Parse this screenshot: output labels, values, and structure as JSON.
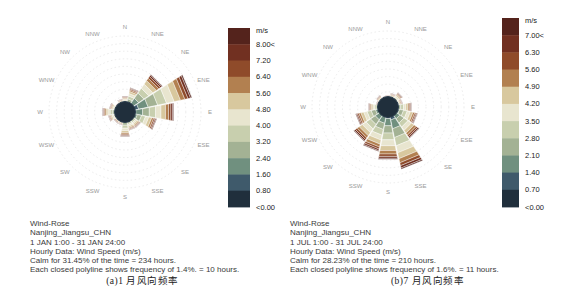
{
  "page": {
    "background": "#ffffff"
  },
  "chart_data": [
    {
      "type": "wind_rose",
      "panel_label": "a",
      "station": "Nanjing_Jiangsu_CHN",
      "period": "1 JAN 1:00 - 31 JAN 24:00",
      "info_lines": [
        "Wind-Rose",
        "Nanjing_Jiangsu_CHN",
        "1 JAN 1:00 - 31 JAN 24:00",
        "Hourly Data: Wind Speed (m/s)",
        "Calm for 31.45% of the time = 234 hours.",
        "Each closed polyline shows frequency of 1.4%. = 10 hours."
      ],
      "caption": "(a)1 月风向频率",
      "calm_pct": 31.45,
      "calm_hours": 234,
      "ring_step_pct": 1.4,
      "ring_count": 10,
      "legend": {
        "unit": "m/s",
        "labels": [
          "8.00<",
          "7.20",
          "6.40",
          "5.60",
          "4.80",
          "4.00",
          "3.20",
          "2.40",
          "1.60",
          "0.80",
          "<0.00"
        ],
        "colors": [
          "#54231c",
          "#713021",
          "#8f4b2a",
          "#b28050",
          "#d8c89e",
          "#e8e5cf",
          "#c8cfae",
          "#a3b294",
          "#70907f",
          "#3f5a6b",
          "#202f3c"
        ]
      },
      "directions": [
        "N",
        "NNE",
        "NE",
        "ENE",
        "E",
        "ESE",
        "SE",
        "SSE",
        "S",
        "SSW",
        "SW",
        "WSW",
        "W",
        "WNW",
        "NW",
        "NNW"
      ],
      "frequencies_pct": [
        3.0,
        4.6,
        8.4,
        12.6,
        9.1,
        6.0,
        3.5,
        3.5,
        4.6,
        2.5,
        2.5,
        3.2,
        4.2,
        3.0,
        2.1,
        2.5
      ],
      "band_profile": [
        0.16,
        0.15,
        0.15,
        0.14,
        0.12,
        0.1,
        0.07,
        0.05,
        0.04,
        0.02
      ]
    },
    {
      "type": "wind_rose",
      "panel_label": "b",
      "station": "Nanjing_Jiangsu_CHN",
      "period": "1 JUL 1:00 - 31 JUL 24:00",
      "info_lines": [
        "Wind-Rose",
        "Nanjing_Jiangsu_CHN",
        "1 JUL 1:00 - 31 JUL 24:00",
        "Hourly Data: Wind Speed (m/s)",
        "Calm for 28.23% of the time = 210 hours.",
        "Each closed polyline shows frequency of 1.6%. = 11 hours."
      ],
      "caption": "(b)7 月风向频率",
      "calm_pct": 28.23,
      "calm_hours": 210,
      "ring_step_pct": 1.6,
      "ring_count": 10,
      "legend": {
        "unit": "m/s",
        "labels": [
          "7.00<",
          "6.30",
          "5.60",
          "4.90",
          "4.20",
          "3.50",
          "2.80",
          "2.10",
          "1.40",
          "0.70",
          "<0.00"
        ],
        "colors": [
          "#54231c",
          "#713021",
          "#8f4b2a",
          "#b28050",
          "#d8c89e",
          "#e8e5cf",
          "#c8cfae",
          "#a3b294",
          "#70907f",
          "#3f5a6b",
          "#202f3c"
        ]
      },
      "directions": [
        "N",
        "NNE",
        "NE",
        "ENE",
        "E",
        "ESE",
        "SE",
        "SSE",
        "S",
        "SSW",
        "SW",
        "WSW",
        "W",
        "WNW",
        "NW",
        "NNW"
      ],
      "frequencies_pct": [
        2.6,
        3.0,
        3.7,
        3.2,
        5.0,
        6.4,
        8.0,
        13.4,
        11.2,
        9.6,
        8.8,
        7.0,
        4.2,
        2.6,
        3.0,
        2.4
      ],
      "band_profile": [
        0.16,
        0.15,
        0.15,
        0.14,
        0.12,
        0.1,
        0.07,
        0.05,
        0.04,
        0.02
      ]
    }
  ]
}
